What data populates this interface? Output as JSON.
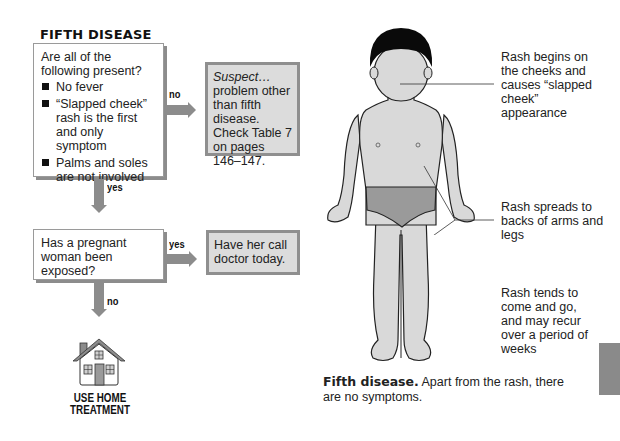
{
  "title": "FIFTH DISEASE",
  "flowchart": {
    "question1": {
      "text": "Are all of the following present?",
      "bullets": [
        "No fever",
        "“Slapped cheek” rash is the first and only symptom",
        "Palms and soles are not involved"
      ]
    },
    "no1_label": "no",
    "answer1": {
      "italic": "Suspect…",
      "text": " problem other than fifth disease. Check Table 7 on pages 146–147."
    },
    "yes1_label": "yes",
    "question2": {
      "text": "Has a pregnant woman been exposed?"
    },
    "yes2_label": "yes",
    "answer2": {
      "text": "Have her call doctor today."
    },
    "no2_label": "no",
    "home": {
      "line1": "USE HOME",
      "line2": "TREATMENT",
      "icon": "house-icon"
    }
  },
  "figure": {
    "annotations": [
      "Rash begins on the cheeks and causes “slapped cheek” appearance",
      "Rash spreads to backs of arms and legs",
      "Rash tends to come and go, and may recur over a period of weeks"
    ],
    "caption_bold": "Fifth disease.",
    "caption_text": " Apart from the rash, there are no symptoms."
  },
  "colors": {
    "arrow": "#8c8c8c",
    "answer_fill": "#dcdcdc",
    "skin": "#d9d9d9",
    "underwear": "#9a9a9a",
    "hair": "#0a0a0a",
    "tab": "#8a8a8a"
  }
}
